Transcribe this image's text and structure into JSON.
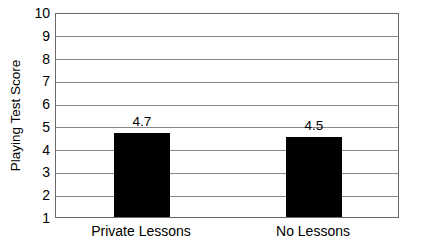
{
  "chart_data": {
    "type": "bar",
    "title": "",
    "subtitle": "",
    "xlabel": "",
    "ylabel": "Playing Test Score",
    "categories": [
      "Private Lessons",
      "No Lessons"
    ],
    "values": [
      4.7,
      4.5
    ],
    "value_labels": [
      "4.7",
      "4.5"
    ],
    "ylim": [
      1,
      10
    ],
    "ytick_labels": [
      "1",
      "2",
      "3",
      "4",
      "5",
      "6",
      "7",
      "8",
      "9",
      "10"
    ],
    "ytick_values": [
      1,
      2,
      3,
      4,
      5,
      6,
      7,
      8,
      9,
      10
    ],
    "grid": "horizontal",
    "legend": "none",
    "bar_color": "#000000",
    "grid_color": "#8a8a8a",
    "axis_color": "#6a6a6a",
    "background_color": "#ffffff",
    "text_color": "#000000"
  }
}
